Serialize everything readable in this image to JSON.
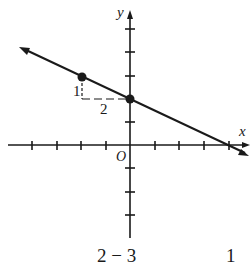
{
  "figure": {
    "axes": {
      "x_label": "x",
      "y_label": "y",
      "origin_label": "O"
    },
    "slope_triangle": {
      "rise_label": "1",
      "run_label": "2"
    },
    "points": [
      {
        "x": -2,
        "y": 3
      },
      {
        "x": 0,
        "y": 2
      }
    ],
    "line": {
      "slope": -0.5,
      "y_intercept": 2,
      "x_intercept": 4
    },
    "bottom_text": {
      "left": "2 − 3",
      "right": "1"
    },
    "colors": {
      "ink": "#1a1a1a",
      "background": "#ffffff"
    }
  }
}
